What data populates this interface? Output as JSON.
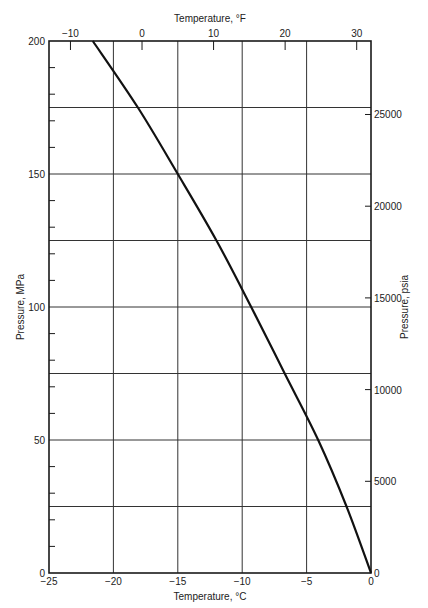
{
  "chart_data": {
    "type": "line",
    "title": "",
    "xlabel": "Temperature, °C",
    "ylabel": "Pressure, MPa",
    "top_xlabel": "Temperature, °F",
    "right_ylabel": "Pressure, psia",
    "xlim": [
      -25,
      0
    ],
    "ylim": [
      0,
      200
    ],
    "grid": true,
    "x_ticks": [
      -25,
      -20,
      -15,
      -10,
      -5,
      0
    ],
    "x_tick_labels": [
      "−25",
      "−20",
      "−15",
      "−10",
      "−5",
      "0"
    ],
    "y_ticks": [
      0,
      50,
      100,
      150,
      200
    ],
    "y_tick_labels": [
      "0",
      "50",
      "100",
      "150",
      "200"
    ],
    "y_minor_ticks": [
      10,
      20,
      30,
      40,
      60,
      70,
      80,
      90,
      110,
      120,
      130,
      140,
      160,
      170,
      180,
      190
    ],
    "h_gridlines": [
      25,
      50,
      75,
      100,
      125,
      150,
      175
    ],
    "v_gridlines": [
      -20,
      -15,
      -10,
      -5
    ],
    "top_ticks_F": [
      -10,
      0,
      10,
      20,
      30
    ],
    "top_tick_labels": [
      "−10",
      "0",
      "10",
      "20",
      "30"
    ],
    "right_ticks_psia": [
      0,
      5000,
      10000,
      15000,
      20000,
      25000
    ],
    "right_tick_labels": [
      "0",
      "5000",
      "10000",
      "15000",
      "20000",
      "25000"
    ],
    "series": [
      {
        "name": "Melting curve",
        "x": [
          0,
          -1.9,
          -4.1,
          -6.7,
          -9.3,
          -12.0,
          -15.0,
          -18.1,
          -21.6
        ],
        "y": [
          0,
          25,
          50,
          75,
          100,
          125,
          150,
          175,
          200
        ]
      }
    ]
  },
  "colors": {
    "axis": "#1a1a1a",
    "grid": "#333333",
    "curve": "#111111",
    "text": "#222222"
  }
}
